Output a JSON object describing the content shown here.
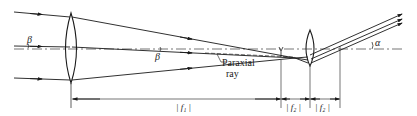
{
  "diagram": {
    "type": "optical-ray-diagram",
    "labels": {
      "beta_left": "β",
      "beta_mid": "β",
      "alpha": "α",
      "paraxial_line1": "Paraxial",
      "paraxial_line2": "ray",
      "f1": "| f₁ |",
      "f2_a": "| f₂ |",
      "f2_b": "| f₂ |"
    },
    "colors": {
      "line": "#1a1a1a",
      "background": "#ffffff"
    }
  }
}
